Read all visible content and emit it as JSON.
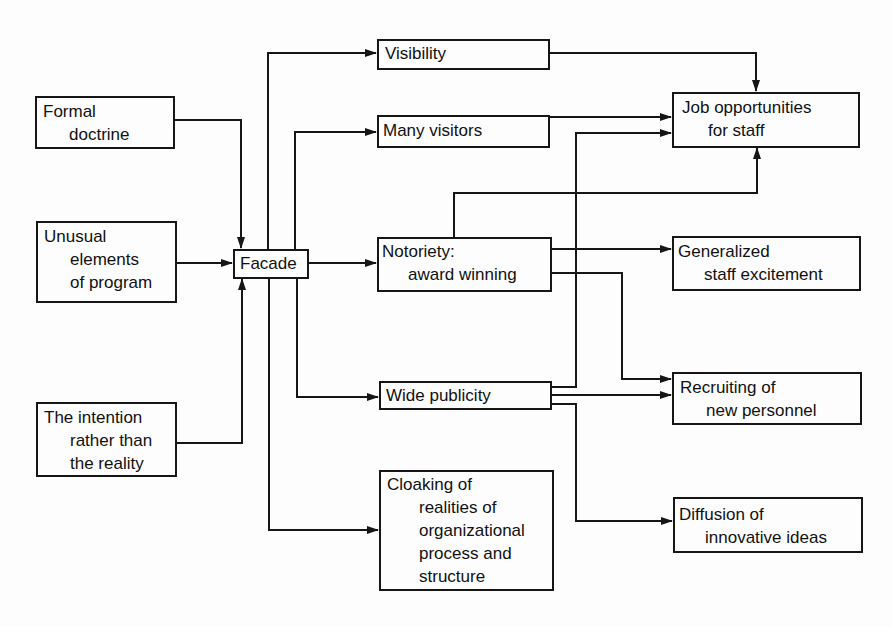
{
  "diagram": {
    "type": "flow-diagram",
    "nodes": {
      "formal_doctrine": {
        "lines": [
          "Formal",
          "doctrine"
        ]
      },
      "unusual_elements": {
        "lines": [
          "Unusual",
          "elements",
          "of program"
        ]
      },
      "intention": {
        "lines": [
          "The intention",
          "rather than",
          "the reality"
        ]
      },
      "facade": {
        "lines": [
          "Facade"
        ]
      },
      "visibility": {
        "lines": [
          "Visibility"
        ]
      },
      "many_visitors": {
        "lines": [
          "Many visitors"
        ]
      },
      "notoriety": {
        "lines": [
          "Notoriety:",
          "award winning"
        ]
      },
      "wide_publicity": {
        "lines": [
          "Wide publicity"
        ]
      },
      "cloaking": {
        "lines": [
          "Cloaking of",
          "realities of",
          "organizational",
          "process and",
          "structure"
        ]
      },
      "job_opportunities": {
        "lines": [
          "Job opportunities",
          "for staff"
        ]
      },
      "staff_excitement": {
        "lines": [
          "Generalized",
          "staff excitement"
        ]
      },
      "recruiting": {
        "lines": [
          "Recruiting of",
          "new personnel"
        ]
      },
      "diffusion": {
        "lines": [
          "Diffusion of",
          "innovative ideas"
        ]
      }
    },
    "edges": [
      [
        "Formal doctrine",
        "Facade"
      ],
      [
        "Unusual elements of program",
        "Facade"
      ],
      [
        "The intention rather than the reality",
        "Facade"
      ],
      [
        "Facade",
        "Visibility"
      ],
      [
        "Facade",
        "Many visitors"
      ],
      [
        "Facade",
        "Notoriety: award winning"
      ],
      [
        "Facade",
        "Wide publicity"
      ],
      [
        "Facade",
        "Cloaking of realities of organizational process and structure"
      ],
      [
        "Visibility",
        "Job opportunities for staff"
      ],
      [
        "Many visitors",
        "Job opportunities for staff"
      ],
      [
        "Notoriety: award winning",
        "Job opportunities for staff"
      ],
      [
        "Notoriety: award winning",
        "Generalized staff excitement"
      ],
      [
        "Notoriety: award winning",
        "Recruiting of new personnel"
      ],
      [
        "Wide publicity",
        "Job opportunities for staff"
      ],
      [
        "Wide publicity",
        "Recruiting of new personnel"
      ],
      [
        "Wide publicity",
        "Diffusion of innovative ideas"
      ]
    ]
  }
}
